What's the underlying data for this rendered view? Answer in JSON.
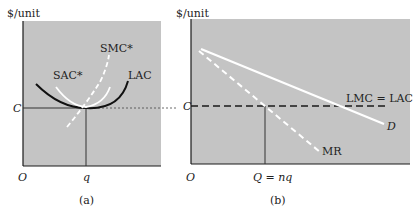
{
  "panel_a": {
    "y_axis_label": "$/unit",
    "origin_label": "O",
    "y_tick_label": "C",
    "x_tick_label": "q",
    "caption": "(a)",
    "curves": {
      "sac": "SAC*",
      "smc": "SMC*",
      "lac": "LAC"
    }
  },
  "panel_b": {
    "y_axis_label": "$/unit",
    "origin_label": "O",
    "y_tick_label": "C",
    "x_tick_label": "Q = nq",
    "caption": "(b)",
    "curves": {
      "lmc_lac": "LMC = LAC",
      "demand": "D",
      "mr": "MR"
    }
  },
  "colors": {
    "panel_bg": "#c4c4c4",
    "axis": "#1a1a1a",
    "white_curve": "#ffffff"
  }
}
